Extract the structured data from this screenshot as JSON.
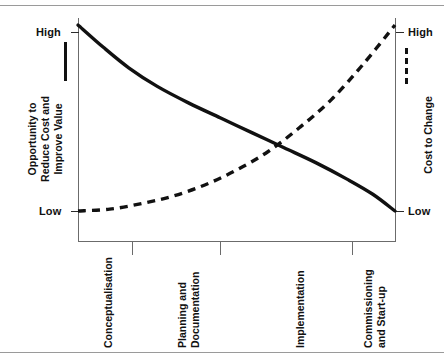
{
  "chart_data": {
    "type": "line",
    "title": "",
    "xlabel": "",
    "ylabel": "Opportunity to Reduce Cost and Improve Value",
    "y2label": "Cost to Change",
    "grid": false,
    "legend_position": "axis-adjacent",
    "categories": [
      "Conceptualisation",
      "Planning and Documentation",
      "Implementation",
      "Commissioning and Start-up"
    ],
    "x": [
      0,
      1,
      2,
      3
    ],
    "ylim": [
      "Low",
      "High"
    ],
    "y_ticks": [
      "Low",
      "High"
    ],
    "y2lim": [
      "Low",
      "High"
    ],
    "y2_ticks": [
      "Low",
      "High"
    ],
    "series": [
      {
        "name": "Opportunity to Reduce Cost and Improve Value",
        "style": "solid",
        "axis": "left",
        "values": [
          1.0,
          0.52,
          0.24,
          0.0
        ],
        "points": [
          [
            0.0,
            1.0
          ],
          [
            0.08,
            0.88
          ],
          [
            0.16,
            0.77
          ],
          [
            0.25,
            0.67
          ],
          [
            0.35,
            0.58
          ],
          [
            0.45,
            0.5
          ],
          [
            0.55,
            0.42
          ],
          [
            0.65,
            0.34
          ],
          [
            0.75,
            0.26
          ],
          [
            0.85,
            0.17
          ],
          [
            0.93,
            0.09
          ],
          [
            1.0,
            0.0
          ]
        ]
      },
      {
        "name": "Cost to Change",
        "style": "dashed",
        "axis": "right",
        "values": [
          0.0,
          0.1,
          0.38,
          1.0
        ],
        "points": [
          [
            0.0,
            0.0
          ],
          [
            0.1,
            0.01
          ],
          [
            0.2,
            0.04
          ],
          [
            0.3,
            0.08
          ],
          [
            0.4,
            0.14
          ],
          [
            0.5,
            0.22
          ],
          [
            0.6,
            0.32
          ],
          [
            0.7,
            0.45
          ],
          [
            0.8,
            0.6
          ],
          [
            0.9,
            0.79
          ],
          [
            1.0,
            1.0
          ]
        ]
      }
    ],
    "crossing_point": {
      "x": 0.58,
      "note": "solid and dashed curves intersect"
    }
  },
  "axes": {
    "left": {
      "title_lines": [
        "Opportunity to",
        "Reduce Cost and",
        "Improve Value"
      ],
      "high_label": "High",
      "low_label": "Low",
      "legend_style": "solid-line"
    },
    "right": {
      "title": "Cost to Change",
      "high_label": "High",
      "low_label": "Low",
      "legend_style": "dashed-line"
    },
    "x_categories": [
      {
        "id": "conceptualisation",
        "lines": [
          "Conceptualisation"
        ]
      },
      {
        "id": "planning-and-documentation",
        "lines": [
          "Planning and",
          "Documentation"
        ]
      },
      {
        "id": "implementation",
        "lines": [
          "Implementation"
        ]
      },
      {
        "id": "commissioning-and-start-up",
        "lines": [
          "Commissioning",
          "and Start-up"
        ]
      }
    ]
  },
  "colors": {
    "ink": "#111111",
    "axis": "#6b6b6b",
    "rule": "#9a9a9a",
    "background": "#ffffff"
  }
}
